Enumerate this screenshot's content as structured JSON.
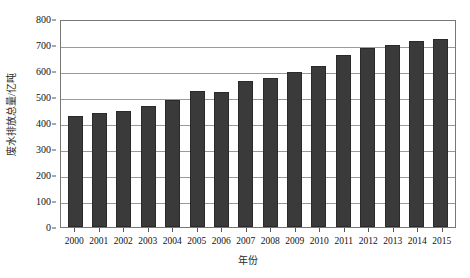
{
  "chart_data": {
    "type": "bar",
    "title": "",
    "xlabel": "年份",
    "ylabel": "废水排放总量/亿吨",
    "categories": [
      "2000",
      "2001",
      "2002",
      "2003",
      "2004",
      "2005",
      "2006",
      "2007",
      "2008",
      "2009",
      "2010",
      "2011",
      "2012",
      "2013",
      "2014",
      "2015"
    ],
    "values": [
      428,
      440,
      445,
      465,
      490,
      525,
      520,
      560,
      575,
      595,
      620,
      660,
      690,
      700,
      715,
      725
    ],
    "ylim": [
      0,
      800
    ],
    "ytick_values": [
      0,
      100,
      200,
      300,
      400,
      500,
      600,
      700,
      800
    ],
    "ytick_labels": [
      "0",
      "100",
      "200",
      "300",
      "400",
      "500",
      "600",
      "700",
      "800"
    ],
    "grid": true,
    "grid_axis": "y",
    "legend": null,
    "legend_position": "none",
    "series": [
      {
        "name": "废水排放总量",
        "values": [
          428,
          440,
          445,
          465,
          490,
          525,
          520,
          560,
          575,
          595,
          620,
          660,
          690,
          700,
          715,
          725
        ]
      }
    ],
    "colors": {
      "bar": "#3a3a3a",
      "bar_border": "#2a2a2a",
      "gridline": "#9a9a9a",
      "axis": "#777777",
      "text": "#111111",
      "background": "#ffffff"
    }
  }
}
